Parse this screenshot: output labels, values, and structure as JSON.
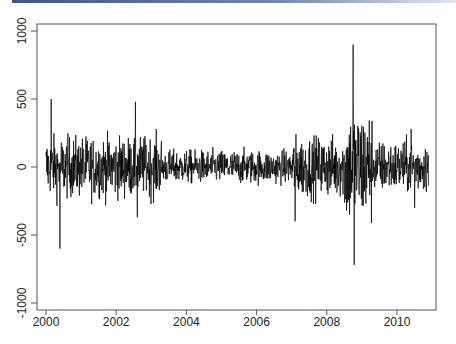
{
  "chart_data": {
    "type": "line",
    "title": "",
    "xlabel": "",
    "ylabel": "",
    "xlim": [
      2000.0,
      2010.95
    ],
    "ylim": [
      -1050,
      1050
    ],
    "grid": false,
    "legend": null,
    "x_ticks": [
      2000,
      2002,
      2004,
      2006,
      2008,
      2010
    ],
    "x_tick_labels": [
      "2000",
      "2002",
      "2004",
      "2006",
      "2008",
      "2010"
    ],
    "y_ticks": [
      1000,
      500,
      0,
      -500,
      -1000
    ],
    "y_tick_labels": [
      "1000",
      "500",
      "0",
      "-500",
      "-1000"
    ],
    "series": [
      {
        "name": "series",
        "color": "#000000",
        "description": "Daily series fluctuating around 0, with volatility clustering; highest volatility in late 2008",
        "key_points": [
          {
            "x": 2000.15,
            "y": 500
          },
          {
            "x": 2000.4,
            "y": -600
          },
          {
            "x": 2002.55,
            "y": 480
          },
          {
            "x": 2002.6,
            "y": -370
          },
          {
            "x": 2007.1,
            "y": -400
          },
          {
            "x": 2008.75,
            "y": 900
          },
          {
            "x": 2008.78,
            "y": -720
          },
          {
            "x": 2010.4,
            "y": 280
          },
          {
            "x": 2010.5,
            "y": -300
          }
        ],
        "volatility_regimes": [
          {
            "from": 2000.0,
            "to": 2003.3,
            "typical_amplitude": 200
          },
          {
            "from": 2003.3,
            "to": 2007.0,
            "typical_amplitude": 110
          },
          {
            "from": 2007.0,
            "to": 2008.5,
            "typical_amplitude": 200
          },
          {
            "from": 2008.5,
            "to": 2009.3,
            "typical_amplitude": 380
          },
          {
            "from": 2009.3,
            "to": 2010.95,
            "typical_amplitude": 170
          }
        ]
      }
    ]
  },
  "plot": {
    "x_tick_labels": [
      "2000",
      "2002",
      "2004",
      "2006",
      "2008",
      "2010"
    ],
    "y_tick_labels": [
      "1000",
      "500",
      "0",
      "-500",
      "-1000"
    ]
  }
}
